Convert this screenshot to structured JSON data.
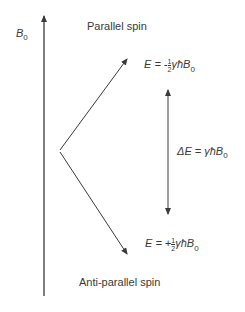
{
  "diagram": {
    "field_label": "B",
    "field_label_sub": "0",
    "parallel_label": "Parallel spin",
    "antiparallel_label": "Anti-parallel spin",
    "upper_energy": {
      "prefix": "E = -",
      "num": "1",
      "den": "2",
      "suffix": "γħB",
      "sub": "0"
    },
    "lower_energy": {
      "prefix": "E = +",
      "num": "1",
      "den": "2",
      "suffix": "γħB",
      "sub": "0"
    },
    "delta": {
      "text": "ΔE = γħB",
      "sub": "0"
    },
    "colors": {
      "line": "#3a3a3a",
      "text": "#3a3a3a"
    }
  }
}
